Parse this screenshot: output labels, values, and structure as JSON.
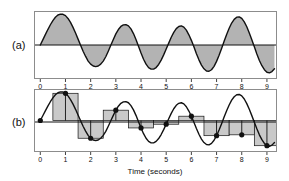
{
  "figure": {
    "panels": [
      {
        "id": "a",
        "label": "(a)",
        "description": "continuous waveform with shaded area"
      },
      {
        "id": "b",
        "label": "(b)",
        "description": "sampled waveform with sample-and-hold bars"
      }
    ],
    "axis": {
      "xlabel": "Time (seconds)",
      "tick_labels": [
        "0",
        "1",
        "2",
        "3",
        "4",
        "5",
        "6",
        "7",
        "8",
        "9"
      ]
    },
    "colors": {
      "fill": "#b3b3b3",
      "hold_fill": "#c9c9c9",
      "curve": "#111111",
      "frame": "#8c8c8c",
      "background": "#ffffff"
    }
  },
  "chart_data": [
    {
      "type": "line",
      "id": "panel-a",
      "title": "",
      "xlabel": "",
      "ylabel": "",
      "xlim": [
        -0.25,
        9.4
      ],
      "ylim": [
        -1.1,
        1.1
      ],
      "grid": false,
      "legend": "none",
      "shaded_to_zero": true,
      "annotation": "(a)",
      "xticks": [
        0,
        1,
        2,
        3,
        4,
        5,
        6,
        7,
        8,
        9
      ],
      "xtick_labels": [
        "0",
        "1",
        "2",
        "3",
        "4",
        "5",
        "6",
        "7",
        "8",
        "9"
      ],
      "description": "Amplitude-modulated (beating) sine wave: sin(2*pi*f*t) envelope large at t=1, small near t=5, large again near t=9",
      "series": [
        {
          "name": "continuous signal",
          "x": [
            0.0,
            0.1,
            0.2,
            0.3,
            0.4,
            0.5,
            0.6,
            0.7,
            0.8,
            0.9,
            1.0,
            1.1,
            1.2,
            1.3,
            1.4,
            1.5,
            1.6,
            1.7,
            1.8,
            1.9,
            2.0,
            2.1,
            2.2,
            2.3,
            2.4,
            2.5,
            2.6,
            2.7,
            2.8,
            2.9,
            3.0,
            3.1,
            3.2,
            3.3,
            3.4,
            3.5,
            3.6,
            3.7,
            3.8,
            3.9,
            4.0,
            4.1,
            4.2,
            4.3,
            4.4,
            4.5,
            4.6,
            4.7,
            4.8,
            4.9,
            5.0,
            5.1,
            5.2,
            5.3,
            5.4,
            5.5,
            5.6,
            5.7,
            5.8,
            5.9,
            6.0,
            6.1,
            6.2,
            6.3,
            6.4,
            6.5,
            6.6,
            6.7,
            6.8,
            6.9,
            7.0,
            7.1,
            7.2,
            7.3,
            7.4,
            7.5,
            7.6,
            7.7,
            7.8,
            7.9,
            8.0,
            8.1,
            8.2,
            8.3,
            8.4,
            8.5,
            8.6,
            8.7,
            8.8,
            8.9,
            9.0,
            9.1,
            9.2,
            9.3
          ],
          "y": [
            0.0,
            0.165,
            0.335,
            0.5,
            0.655,
            0.79,
            0.897,
            0.97,
            1.0,
            0.993,
            0.95,
            0.86,
            0.73,
            0.57,
            0.39,
            0.19,
            -0.01,
            -0.2,
            -0.37,
            -0.52,
            -0.62,
            -0.68,
            -0.7,
            -0.68,
            -0.62,
            -0.52,
            -0.38,
            -0.2,
            -0.01,
            0.18,
            0.36,
            0.5,
            0.6,
            0.65,
            0.66,
            0.62,
            0.52,
            0.37,
            0.18,
            -0.04,
            -0.26,
            -0.46,
            -0.62,
            -0.73,
            -0.78,
            -0.78,
            -0.73,
            -0.63,
            -0.49,
            -0.32,
            -0.13,
            0.06,
            0.25,
            0.41,
            0.53,
            0.6,
            0.62,
            0.58,
            0.48,
            0.33,
            0.15,
            -0.06,
            -0.28,
            -0.48,
            -0.65,
            -0.77,
            -0.84,
            -0.85,
            -0.8,
            -0.69,
            -0.53,
            -0.33,
            -0.11,
            0.12,
            0.34,
            0.54,
            0.71,
            0.83,
            0.9,
            0.91,
            0.86,
            0.75,
            0.59,
            0.39,
            0.17,
            -0.06,
            -0.29,
            -0.5,
            -0.67,
            -0.8,
            -0.88,
            -0.9,
            -0.86,
            -0.77
          ]
        }
      ]
    },
    {
      "type": "line",
      "id": "panel-b",
      "title": "",
      "xlabel": "Time (seconds)",
      "ylabel": "",
      "xlim": [
        -0.25,
        9.4
      ],
      "ylim": [
        -1.1,
        1.1
      ],
      "grid": false,
      "legend": "none",
      "annotation": "(b)",
      "xticks": [
        0,
        1,
        2,
        3,
        4,
        5,
        6,
        7,
        8,
        9
      ],
      "xtick_labels": [
        "0",
        "1",
        "2",
        "3",
        "4",
        "5",
        "6",
        "7",
        "8",
        "9"
      ],
      "description": "Same waveform overlaid with 1-second sample-and-hold rectangles and sample dots at integer times",
      "series": [
        {
          "name": "continuous signal",
          "x": [
            0.0,
            0.1,
            0.2,
            0.3,
            0.4,
            0.5,
            0.6,
            0.7,
            0.8,
            0.9,
            1.0,
            1.1,
            1.2,
            1.3,
            1.4,
            1.5,
            1.6,
            1.7,
            1.8,
            1.9,
            2.0,
            2.1,
            2.2,
            2.3,
            2.4,
            2.5,
            2.6,
            2.7,
            2.8,
            2.9,
            3.0,
            3.1,
            3.2,
            3.3,
            3.4,
            3.5,
            3.6,
            3.7,
            3.8,
            3.9,
            4.0,
            4.1,
            4.2,
            4.3,
            4.4,
            4.5,
            4.6,
            4.7,
            4.8,
            4.9,
            5.0,
            5.1,
            5.2,
            5.3,
            5.4,
            5.5,
            5.6,
            5.7,
            5.8,
            5.9,
            6.0,
            6.1,
            6.2,
            6.3,
            6.4,
            6.5,
            6.6,
            6.7,
            6.8,
            6.9,
            7.0,
            7.1,
            7.2,
            7.3,
            7.4,
            7.5,
            7.6,
            7.7,
            7.8,
            7.9,
            8.0,
            8.1,
            8.2,
            8.3,
            8.4,
            8.5,
            8.6,
            8.7,
            8.8,
            8.9,
            9.0,
            9.1,
            9.2,
            9.3
          ],
          "y": [
            0.0,
            0.165,
            0.335,
            0.5,
            0.655,
            0.79,
            0.897,
            0.97,
            1.0,
            0.993,
            0.95,
            0.86,
            0.73,
            0.57,
            0.39,
            0.19,
            -0.01,
            -0.2,
            -0.37,
            -0.52,
            -0.62,
            -0.68,
            -0.7,
            -0.68,
            -0.62,
            -0.52,
            -0.38,
            -0.2,
            -0.01,
            0.18,
            0.36,
            0.5,
            0.6,
            0.65,
            0.66,
            0.62,
            0.52,
            0.37,
            0.18,
            -0.04,
            -0.26,
            -0.46,
            -0.62,
            -0.73,
            -0.78,
            -0.78,
            -0.73,
            -0.63,
            -0.49,
            -0.32,
            -0.13,
            0.06,
            0.25,
            0.41,
            0.53,
            0.6,
            0.62,
            0.58,
            0.48,
            0.33,
            0.15,
            -0.06,
            -0.28,
            -0.48,
            -0.65,
            -0.77,
            -0.84,
            -0.85,
            -0.8,
            -0.69,
            -0.53,
            -0.33,
            -0.11,
            0.12,
            0.34,
            0.54,
            0.71,
            0.83,
            0.9,
            0.91,
            0.86,
            0.75,
            0.59,
            0.39,
            0.17,
            -0.06,
            -0.29,
            -0.5,
            -0.67,
            -0.8,
            -0.88,
            -0.9,
            -0.86,
            -0.77
          ]
        },
        {
          "name": "samples",
          "type": "scatter",
          "x": [
            0,
            1,
            2,
            3,
            4,
            5,
            6,
            7,
            8,
            9
          ],
          "y": [
            0.0,
            0.95,
            -0.62,
            0.36,
            -0.26,
            -0.13,
            0.15,
            -0.53,
            -0.5,
            -0.88
          ]
        },
        {
          "name": "sample-and-hold bars",
          "type": "bar",
          "bar_width": 1.0,
          "x": [
            0,
            1,
            2,
            3,
            4,
            5,
            6,
            7,
            8,
            9
          ],
          "y": [
            0.0,
            0.95,
            -0.62,
            0.36,
            -0.26,
            -0.13,
            0.15,
            -0.53,
            -0.5,
            -0.88
          ]
        }
      ]
    }
  ]
}
